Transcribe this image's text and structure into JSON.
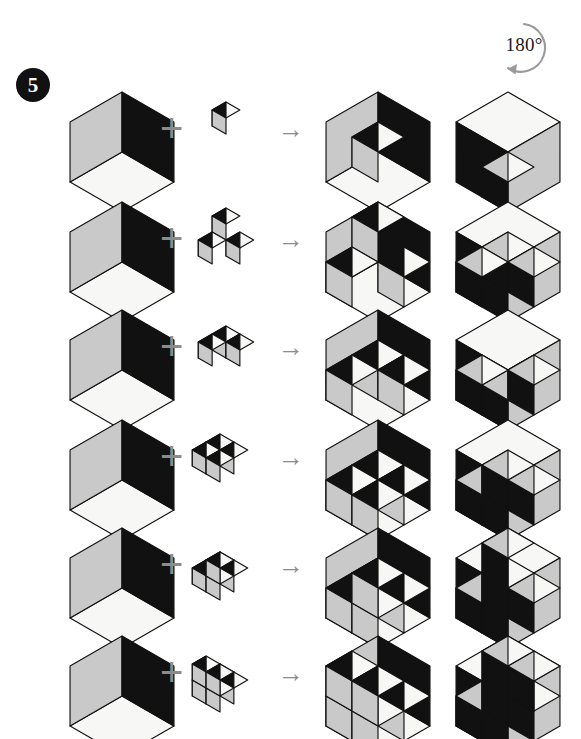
{
  "page": {
    "background": "#ffffff",
    "width": 581,
    "height": 739,
    "badge_number": "5",
    "badge_color": "#111111"
  },
  "rotation_marker": {
    "label": "180°",
    "icon": "rotate-ccw-arrow",
    "stroke": "#9a9a9a"
  },
  "palette": {
    "face_light": "#f7f7f5",
    "face_gray": "#c9c9c9",
    "face_dark": "#111111",
    "outline": "#111111",
    "operator": "#8c8c8c"
  },
  "operators": {
    "plus": "+",
    "arrow": "→",
    "plus_name": "plus-operator",
    "arrow_name": "arrow-operator"
  },
  "columns": [
    {
      "name": "base-shell",
      "label": "Base open box",
      "x": 62
    },
    {
      "name": "plus-operator",
      "label": "+",
      "x": 160
    },
    {
      "name": "addend-piece",
      "label": "Added piece",
      "x": 190
    },
    {
      "name": "arrow-operator",
      "label": "→",
      "x": 278
    },
    {
      "name": "result-assembly",
      "label": "Assembled result",
      "x": 318
    },
    {
      "name": "rotated-result",
      "label": "Result rotated 180°",
      "x": 448
    }
  ],
  "rows": [
    {
      "index": 1,
      "y": 78,
      "addend_name": "single-cube",
      "addend_label": "1 cube",
      "addend_cells": [
        [
          0,
          0,
          0
        ]
      ],
      "addend_scale": 16,
      "addend_offset": [
        36,
        40
      ],
      "result_name": "shell-plus-single-cube",
      "result_cells": [
        [
          0,
          0,
          0
        ]
      ],
      "rotated_name": "rotated-shell-plus-single-cube"
    },
    {
      "index": 2,
      "y": 188,
      "addend_name": "tripod-up",
      "addend_label": "3 cubes, corner tripod",
      "addend_cells": [
        [
          0,
          0,
          1
        ],
        [
          0,
          1,
          0
        ],
        [
          1,
          0,
          0
        ]
      ],
      "addend_scale": 16,
      "addend_offset": [
        36,
        52
      ],
      "result_name": "shell-plus-tripod-up",
      "result_cells": [
        [
          0,
          0,
          1
        ],
        [
          0,
          1,
          0
        ],
        [
          1,
          0,
          0
        ]
      ],
      "rotated_name": "rotated-shell-plus-tripod-up"
    },
    {
      "index": 3,
      "y": 296,
      "addend_name": "tripod-flat",
      "addend_label": "3 cubes, flat tripod",
      "addend_cells": [
        [
          0,
          0,
          0
        ],
        [
          1,
          0,
          0
        ],
        [
          0,
          1,
          0
        ]
      ],
      "addend_scale": 16,
      "addend_offset": [
        36,
        46
      ],
      "result_name": "shell-plus-tripod-flat",
      "result_cells": [
        [
          0,
          0,
          0
        ],
        [
          1,
          0,
          0
        ],
        [
          0,
          1,
          0
        ]
      ],
      "rotated_name": "rotated-shell-plus-tripod-flat"
    },
    {
      "index": 4,
      "y": 406,
      "addend_name": "flat-slab",
      "addend_label": "2x2 flat slab",
      "addend_cells": [
        [
          0,
          0,
          0
        ],
        [
          1,
          0,
          0
        ],
        [
          0,
          1,
          0
        ],
        [
          1,
          1,
          0
        ]
      ],
      "addend_scale": 16,
      "addend_offset": [
        30,
        44
      ],
      "result_name": "shell-plus-flat-slab",
      "result_cells": [
        [
          0,
          0,
          0
        ],
        [
          1,
          0,
          0
        ],
        [
          0,
          1,
          0
        ],
        [
          1,
          1,
          0
        ]
      ],
      "rotated_name": "rotated-shell-plus-flat-slab"
    },
    {
      "index": 5,
      "y": 514,
      "addend_name": "slab-with-cube",
      "addend_label": "slab plus one cube on top",
      "addend_cells": [
        [
          0,
          0,
          0
        ],
        [
          1,
          0,
          0
        ],
        [
          0,
          1,
          0
        ],
        [
          1,
          1,
          0
        ],
        [
          1,
          1,
          1
        ]
      ],
      "addend_scale": 16,
      "addend_offset": [
        30,
        54
      ],
      "result_name": "shell-plus-slab-with-cube",
      "result_cells": [
        [
          0,
          0,
          0
        ],
        [
          1,
          0,
          0
        ],
        [
          0,
          1,
          0
        ],
        [
          1,
          1,
          0
        ],
        [
          1,
          1,
          1
        ]
      ],
      "rotated_name": "rotated-shell-plus-slab-with-cube"
    },
    {
      "index": 6,
      "y": 622,
      "addend_name": "stepped-block",
      "addend_label": "stepped block",
      "addend_cells": [
        [
          0,
          0,
          0
        ],
        [
          1,
          0,
          0
        ],
        [
          0,
          1,
          0
        ],
        [
          1,
          1,
          0
        ],
        [
          0,
          1,
          1
        ],
        [
          1,
          1,
          1
        ]
      ],
      "addend_scale": 16,
      "addend_offset": [
        30,
        58
      ],
      "result_name": "shell-plus-stepped-block",
      "result_cells": [
        [
          0,
          0,
          0
        ],
        [
          1,
          0,
          0
        ],
        [
          0,
          1,
          0
        ],
        [
          1,
          1,
          0
        ],
        [
          0,
          1,
          1
        ],
        [
          1,
          1,
          1
        ]
      ],
      "rotated_name": "rotated-shell-plus-stepped-block"
    }
  ]
}
